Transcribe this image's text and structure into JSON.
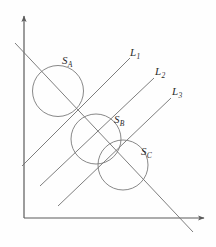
{
  "figure": {
    "background_color": "#fefefe",
    "stroke_color": "#6f6f6f",
    "label_color": "#2b2b2b",
    "width": 216,
    "height": 247
  },
  "axes": {
    "origin": {
      "x": 24,
      "y": 218
    },
    "y_axis": {
      "name": "y-axis",
      "from": {
        "x": 24,
        "y": 218
      },
      "to": {
        "x": 24,
        "y": 14
      },
      "arrow": true
    },
    "x_axis": {
      "name": "x-axis",
      "from": {
        "x": 24,
        "y": 218
      },
      "to": {
        "x": 206,
        "y": 218
      },
      "arrow": true
    }
  },
  "lines": [
    {
      "id": "L1",
      "label": "L",
      "subscript": "1",
      "label_pos": {
        "x": 130,
        "y": 47
      },
      "from": {
        "x": 22,
        "y": 166
      },
      "to": {
        "x": 130,
        "y": 58
      }
    },
    {
      "id": "L2",
      "label": "L",
      "subscript": "2",
      "label_pos": {
        "x": 155,
        "y": 66
      },
      "from": {
        "x": 40,
        "y": 186
      },
      "to": {
        "x": 154,
        "y": 78
      }
    },
    {
      "id": "L3",
      "label": "L",
      "subscript": "3",
      "label_pos": {
        "x": 172,
        "y": 86
      },
      "from": {
        "x": 58,
        "y": 206
      },
      "to": {
        "x": 171,
        "y": 98
      }
    },
    {
      "id": "D",
      "label": "",
      "subscript": "",
      "label_pos": {
        "x": 0,
        "y": 0
      },
      "from": {
        "x": 15,
        "y": 43
      },
      "to": {
        "x": 193,
        "y": 232
      }
    }
  ],
  "circles": [
    {
      "id": "SA",
      "label": "S",
      "subscript": "A",
      "label_pos": {
        "x": 62,
        "y": 55
      },
      "center": {
        "x": 58,
        "y": 91
      },
      "radius": 25.5
    },
    {
      "id": "SB",
      "label": "S",
      "subscript": "B",
      "label_pos": {
        "x": 114,
        "y": 114
      },
      "center": {
        "x": 96,
        "y": 139
      },
      "radius": 25
    },
    {
      "id": "SC",
      "label": "S",
      "subscript": "C",
      "label_pos": {
        "x": 141,
        "y": 146
      },
      "center": {
        "x": 123,
        "y": 165
      },
      "radius": 25
    }
  ]
}
